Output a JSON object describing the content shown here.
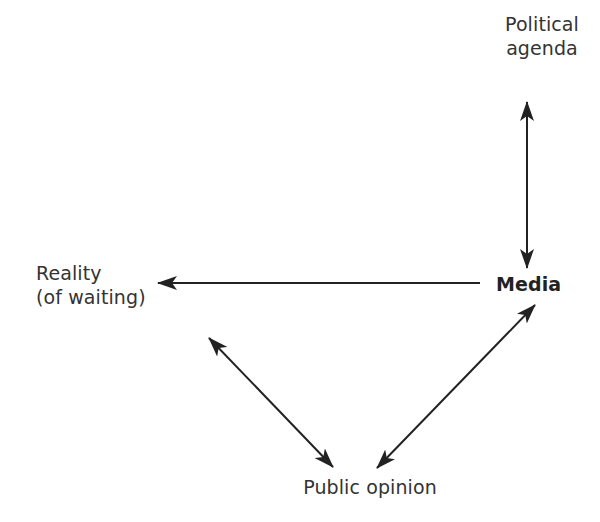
{
  "diagram": {
    "nodes": {
      "political_agenda": {
        "line1": "Political",
        "line2": "agenda"
      },
      "reality": {
        "line1": "Reality",
        "line2": "(of waiting)"
      },
      "media": {
        "label": "Media"
      },
      "public_opinion": {
        "label": "Public opinion"
      }
    },
    "edges": [
      {
        "from": "Political agenda",
        "to": "Media",
        "direction": "bidirectional"
      },
      {
        "from": "Media",
        "to": "Reality (of waiting)",
        "direction": "one-way"
      },
      {
        "from": "Reality (of waiting)",
        "to": "Public opinion",
        "direction": "bidirectional"
      },
      {
        "from": "Media",
        "to": "Public opinion",
        "direction": "bidirectional"
      }
    ],
    "colors": {
      "stroke": "#222222",
      "text": "#333333",
      "background": "#ffffff"
    }
  }
}
